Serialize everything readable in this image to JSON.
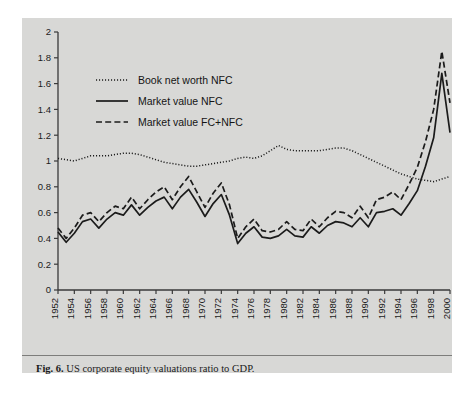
{
  "figure": {
    "label": "Fig. 6.",
    "caption": "US corporate equity valuations ratio to GDP."
  },
  "colors": {
    "panel": "#d8d8d6",
    "page": "#ffffff",
    "ink": "#1b1b1b",
    "axis": "#3a3a3a",
    "separator": "#7d7d7b"
  },
  "chart_data": {
    "type": "line",
    "title": "US corporate equity valuations ratio to GDP",
    "xlabel": "",
    "ylabel": "",
    "xlim": [
      1952,
      2000
    ],
    "ylim": [
      0,
      2
    ],
    "grid": false,
    "legend_position": "top-left",
    "yticks": [
      0,
      0.2,
      0.4,
      0.6,
      0.8,
      1,
      1.2,
      1.4,
      1.6,
      1.8,
      2
    ],
    "ytick_labels": [
      "0",
      "0.2",
      "0.4",
      "0.6",
      "0.8",
      "1",
      "1.2",
      "1.4",
      "1.6",
      "1.8",
      "2"
    ],
    "xticks": [
      1952,
      1954,
      1956,
      1958,
      1960,
      1962,
      1964,
      1966,
      1968,
      1970,
      1972,
      1974,
      1976,
      1978,
      1980,
      1982,
      1984,
      1986,
      1988,
      1990,
      1992,
      1994,
      1996,
      1998,
      2000
    ],
    "xtick_labels": [
      "1952",
      "1954",
      "1956",
      "1958",
      "1960",
      "1962",
      "1964",
      "1966",
      "1968",
      "1970",
      "1972",
      "1974",
      "1976",
      "1978",
      "1980",
      "1982",
      "1984",
      "1986",
      "1988",
      "1990",
      "1992",
      "1994",
      "1996",
      "1998",
      "2000"
    ],
    "x": [
      1952,
      1953,
      1954,
      1955,
      1956,
      1957,
      1958,
      1959,
      1960,
      1961,
      1962,
      1963,
      1964,
      1965,
      1966,
      1967,
      1968,
      1969,
      1970,
      1971,
      1972,
      1973,
      1974,
      1975,
      1976,
      1977,
      1978,
      1979,
      1980,
      1981,
      1982,
      1983,
      1984,
      1985,
      1986,
      1987,
      1988,
      1989,
      1990,
      1991,
      1992,
      1993,
      1994,
      1995,
      1996,
      1997,
      1998,
      1999,
      2000
    ],
    "series": [
      {
        "name": "Book net worth NFC",
        "style": "dotted",
        "values": [
          1.02,
          1.01,
          1.0,
          1.02,
          1.04,
          1.04,
          1.04,
          1.05,
          1.06,
          1.06,
          1.05,
          1.03,
          1.01,
          0.99,
          0.98,
          0.97,
          0.96,
          0.96,
          0.97,
          0.98,
          0.99,
          1.0,
          1.02,
          1.03,
          1.02,
          1.04,
          1.08,
          1.12,
          1.09,
          1.08,
          1.08,
          1.08,
          1.08,
          1.09,
          1.1,
          1.1,
          1.08,
          1.05,
          1.02,
          0.99,
          0.96,
          0.93,
          0.9,
          0.88,
          0.86,
          0.85,
          0.84,
          0.86,
          0.88
        ]
      },
      {
        "name": "Market value NFC",
        "style": "solid",
        "values": [
          0.45,
          0.37,
          0.44,
          0.53,
          0.55,
          0.48,
          0.55,
          0.6,
          0.58,
          0.66,
          0.58,
          0.64,
          0.69,
          0.72,
          0.63,
          0.72,
          0.78,
          0.68,
          0.57,
          0.67,
          0.74,
          0.58,
          0.36,
          0.44,
          0.49,
          0.41,
          0.4,
          0.42,
          0.47,
          0.42,
          0.41,
          0.49,
          0.44,
          0.5,
          0.53,
          0.52,
          0.49,
          0.56,
          0.49,
          0.6,
          0.61,
          0.63,
          0.58,
          0.67,
          0.77,
          0.96,
          1.18,
          1.68,
          1.22
        ]
      },
      {
        "name": "Market value FC+NFC",
        "style": "dashed",
        "values": [
          0.48,
          0.4,
          0.48,
          0.58,
          0.6,
          0.53,
          0.6,
          0.65,
          0.63,
          0.72,
          0.63,
          0.7,
          0.76,
          0.8,
          0.7,
          0.8,
          0.88,
          0.76,
          0.64,
          0.75,
          0.83,
          0.66,
          0.4,
          0.49,
          0.55,
          0.46,
          0.45,
          0.47,
          0.53,
          0.47,
          0.46,
          0.55,
          0.49,
          0.56,
          0.61,
          0.6,
          0.56,
          0.65,
          0.56,
          0.7,
          0.72,
          0.76,
          0.7,
          0.82,
          0.95,
          1.15,
          1.4,
          1.85,
          1.45
        ]
      }
    ]
  }
}
